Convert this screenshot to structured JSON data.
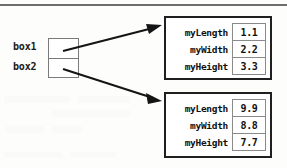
{
  "figure": {
    "type": "object-reference-diagram",
    "background_color": "#fdfdfc",
    "rule_color": "#6e6e6e",
    "box_border_color": "#1f1f1f",
    "cell_border_color": "#8a8a8a",
    "text_color": "#111111"
  },
  "references": [
    {
      "label": "box1",
      "points_to": "object-1"
    },
    {
      "label": "box2",
      "points_to": "object-2"
    }
  ],
  "objects": [
    {
      "id": "object-1",
      "fields": [
        {
          "name": "myLength",
          "value": "1.1"
        },
        {
          "name": "myWidth",
          "value": "2.2"
        },
        {
          "name": "myHeight",
          "value": "3.3"
        }
      ]
    },
    {
      "id": "object-2",
      "fields": [
        {
          "name": "myLength",
          "value": "9.9"
        },
        {
          "name": "myWidth",
          "value": "8.8"
        },
        {
          "name": "myHeight",
          "value": "7.7"
        }
      ]
    }
  ],
  "arrows": [
    {
      "name": "arrow-box1-to-object-1",
      "from": "box1-cell",
      "to": "object-1"
    },
    {
      "name": "arrow-box2-to-object-2",
      "from": "box2-cell",
      "to": "object-2"
    }
  ]
}
